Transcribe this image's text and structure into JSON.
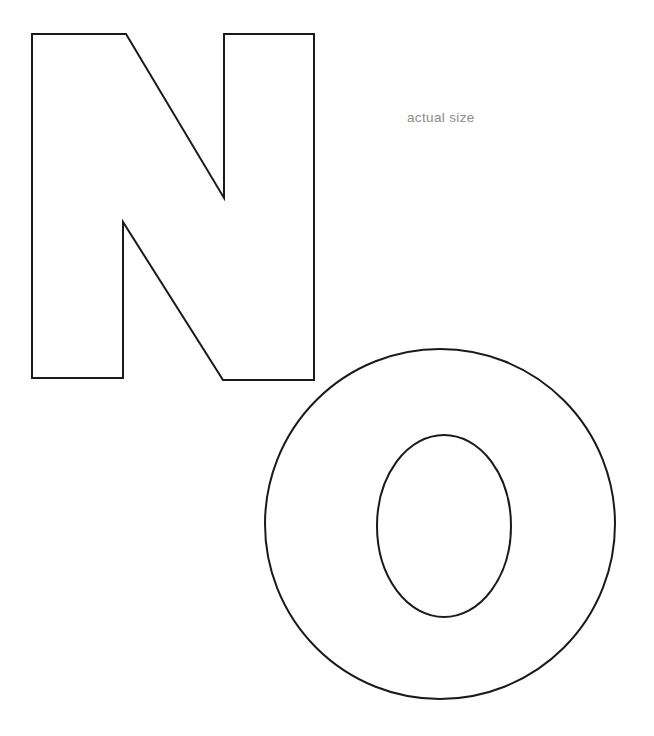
{
  "page": {
    "background_color": "#ffffff",
    "width": 654,
    "height": 736
  },
  "caption": {
    "text": "actual size",
    "color": "#8c8c8c",
    "x": 407,
    "y": 111
  },
  "style": {
    "stroke_color": "#1a1a1a",
    "stroke_width": 2,
    "fill_color": "#ffffff"
  },
  "shapes": [
    {
      "id": "letter-n",
      "name": "letter-n-outline",
      "label": "N",
      "type": "polygon",
      "points": "32,34 126,34 224,198 224,34 314,34 314,380 223,380 123,222 123,378 32,378",
      "bbox": {
        "x": 32,
        "y": 34,
        "width": 282,
        "height": 346
      }
    },
    {
      "id": "letter-o",
      "name": "letter-o-outline",
      "label": "O",
      "type": "ring",
      "outer": {
        "cx": 440,
        "cy": 524,
        "rx": 176,
        "ry": 176
      },
      "inner": {
        "cx": 444,
        "cy": 526,
        "rx": 68,
        "ry": 92
      },
      "bbox": {
        "x": 264,
        "y": 348,
        "width": 352,
        "height": 352
      }
    }
  ]
}
